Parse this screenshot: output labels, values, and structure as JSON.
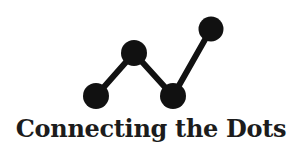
{
  "logo": {
    "title": "Connecting the Dots",
    "icon": "connected-dots-line-icon",
    "colors": {
      "background": "#ffffff",
      "foreground": "#111111",
      "text": "#1c1c1c"
    },
    "dots": [
      {
        "cx": 96,
        "cy": 96,
        "r": 13
      },
      {
        "cx": 134,
        "cy": 53,
        "r": 13
      },
      {
        "cx": 173,
        "cy": 96,
        "r": 13
      },
      {
        "cx": 211,
        "cy": 29,
        "r": 12.5
      }
    ],
    "line_width": 6
  }
}
